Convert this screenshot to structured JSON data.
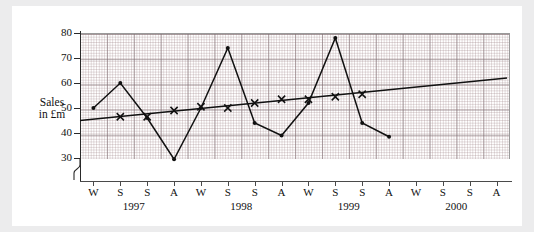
{
  "axis_label": {
    "line1": "Sales",
    "line2": "in £m"
  },
  "chart_data": {
    "type": "line",
    "title": "",
    "xlabel": "",
    "ylabel": "Sales in £m",
    "ylim": [
      25,
      80
    ],
    "yticks": [
      30,
      40,
      50,
      60,
      70,
      80
    ],
    "ytick_labels": [
      "30",
      "40",
      "50",
      "60",
      "70",
      "80"
    ],
    "grid": true,
    "axis_break": true,
    "legend_position": "none",
    "categories": [
      "W",
      "S",
      "S",
      "A",
      "W",
      "S",
      "S",
      "A",
      "W",
      "S",
      "S",
      "A",
      "W",
      "S",
      "S",
      "A"
    ],
    "x": [
      "W 1997",
      "S 1997",
      "S 1997",
      "A 1997",
      "W 1998",
      "S 1998",
      "S 1998",
      "A 1998",
      "W 1999",
      "S 1999",
      "S 1999",
      "A 1999",
      "W 2000",
      "S 2000",
      "S 2000",
      "A 2000"
    ],
    "year_groups": [
      {
        "label": "1997",
        "start_index": 0,
        "end_index": 3
      },
      {
        "label": "1998",
        "start_index": 4,
        "end_index": 7
      },
      {
        "label": "1999",
        "start_index": 8,
        "end_index": 11
      },
      {
        "label": "2000",
        "start_index": 12,
        "end_index": 15
      }
    ],
    "series": [
      {
        "name": "Sales",
        "marker": "dot",
        "values": [
          50,
          60,
          46,
          29.5,
          50,
          74,
          44,
          39,
          52,
          78,
          44,
          38.5,
          null,
          null,
          null,
          null
        ]
      },
      {
        "name": "4-point moving average",
        "marker": "cross",
        "values": [
          null,
          46.5,
          46.5,
          49,
          50.5,
          50,
          52,
          53.5,
          53.5,
          54.5,
          55.5,
          null,
          null,
          null,
          null,
          null
        ]
      }
    ],
    "trend_line": {
      "name": "Trend line",
      "x_start_index": 0,
      "x_end_index": 15,
      "y_start": 45,
      "y_end": 62
    }
  }
}
